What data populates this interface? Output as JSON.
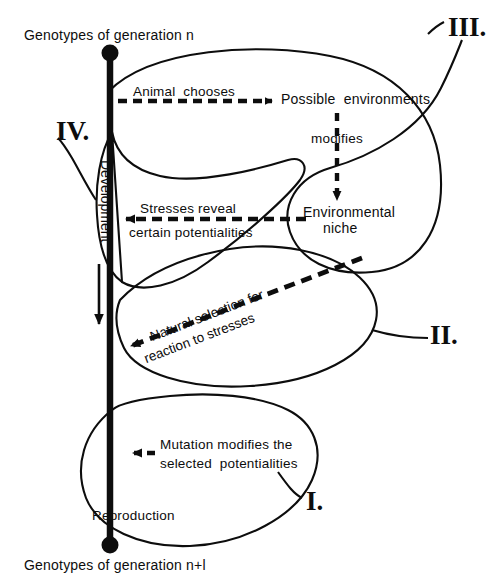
{
  "figure": {
    "top_label": "Genotypes of generation n",
    "bottom_label": "Genotypes of generation n+l",
    "axis_label": "Development",
    "reproduction_label": "Reproduction"
  },
  "nodes": {
    "possible_environments": "Possible  environments",
    "environmental_niche_line1": "Environmental",
    "environmental_niche_line2": "niche"
  },
  "arrows": {
    "animal_chooses": "Animal  chooses",
    "modifies": "modifies",
    "stresses_line1": "Stresses reveal",
    "stresses_line2": "certain potentialities",
    "natural_selection_line1": "Natural selection for",
    "natural_selection_line2": "reaction to stresses",
    "mutation_line1": "Mutation modifies the",
    "mutation_line2": "selected  potentialities"
  },
  "loops": {
    "loop1": "I.",
    "loop2": "II.",
    "loop3": "III.",
    "loop4": "IV."
  },
  "colors": {
    "ink": "#0d0d0d",
    "background": "#ffffff"
  }
}
